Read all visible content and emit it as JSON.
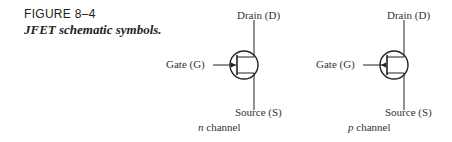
{
  "caption": {
    "figure_number": "FIGURE 8–4",
    "title": "JFET schematic symbols."
  },
  "symbols": [
    {
      "type": "n",
      "drain_label": "Drain (D)",
      "gate_label": "Gate (G)",
      "source_label": "Source (S)",
      "channel_letter": "n",
      "channel_word": " channel",
      "arrow_direction": "inward"
    },
    {
      "type": "p",
      "drain_label": "Drain (D)",
      "gate_label": "Gate (G)",
      "source_label": "Source (S)",
      "channel_letter": "p",
      "channel_word": " channel",
      "arrow_direction": "outward"
    }
  ]
}
